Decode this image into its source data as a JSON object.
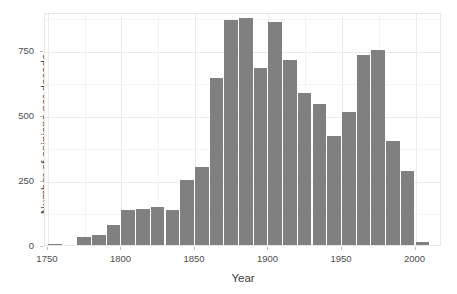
{
  "figure": {
    "clipped_title": "…",
    "bar_color": "#808080",
    "panel_background": "#ffffff",
    "gridline_color": "#ebebeb"
  },
  "chart_data": {
    "type": "bar",
    "title": "",
    "xlabel": "Year",
    "ylabel": "Number of opinions per decade",
    "xlim": [
      1748,
      2018
    ],
    "ylim": [
      0,
      895
    ],
    "grid": true,
    "legend": false,
    "bin_width": 10,
    "xticks": [
      "1750",
      "1800",
      "1850",
      "1900",
      "1950",
      "2000"
    ],
    "xtick_values": [
      1750,
      1800,
      1850,
      1900,
      1950,
      2000
    ],
    "yticks": [
      "0",
      "250",
      "500",
      "750"
    ],
    "ytick_values": [
      0,
      250,
      500,
      750
    ],
    "categories": [
      1755,
      1765,
      1775,
      1785,
      1795,
      1805,
      1815,
      1825,
      1835,
      1845,
      1855,
      1865,
      1875,
      1885,
      1895,
      1905,
      1915,
      1925,
      1935,
      1945,
      1955,
      1965,
      1975,
      1985,
      1995,
      2005
    ],
    "values": [
      5,
      0,
      30,
      40,
      78,
      133,
      140,
      145,
      135,
      250,
      300,
      640,
      865,
      872,
      680,
      858,
      710,
      583,
      540,
      420,
      512,
      728,
      750,
      400,
      283,
      13
    ]
  }
}
